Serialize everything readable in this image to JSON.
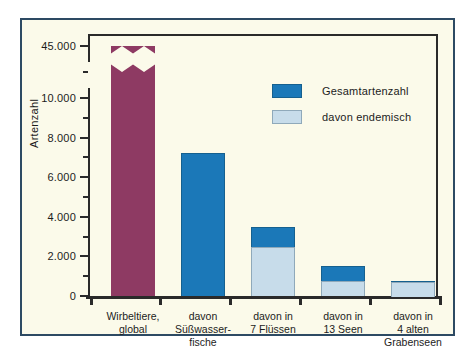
{
  "chart_data": {
    "type": "bar",
    "title": "",
    "xlabel": "",
    "ylabel": "Artenzahl",
    "grid": false,
    "legend_position": "inside-top-right",
    "axis_break": {
      "present": true,
      "below": 10000,
      "above": 45000,
      "note": "y-axis is broken between 10.000 and 45.000"
    },
    "ylim": [
      0,
      10000
    ],
    "yticks_major": [
      0,
      2000,
      4000,
      6000,
      8000,
      10000,
      45000
    ],
    "ytick_labels": [
      "0",
      "2.000",
      "4.000",
      "6.000",
      "8.000",
      "10.000",
      "45.000"
    ],
    "yticks_minor": [
      1000,
      3000,
      5000,
      7000,
      9000
    ],
    "categories": [
      "Wirbeltiere,\nglobal",
      "davon\nSüßwasser-\nfische",
      "davon in\n7 Flüssen",
      "davon in\n13 Seen",
      "davon in\n4 alten\nGrabenseen"
    ],
    "series": [
      {
        "name": "Gesamtartenzahl",
        "color": "#1b78b8",
        "values": [
          45000,
          7200,
          3500,
          1500,
          750
        ]
      },
      {
        "name": "davon endemisch",
        "color": "#c7dcea",
        "values": [
          null,
          null,
          2500,
          750,
          750
        ]
      }
    ],
    "special_bar": {
      "index": 0,
      "label": "Wirbeltiere, global",
      "color": "#8e3a63",
      "value": 45000,
      "broken": true
    },
    "legend": [
      {
        "label": "Gesamtartenzahl",
        "swatch": "total"
      },
      {
        "label": "davon endemisch",
        "swatch": "endemic"
      }
    ]
  },
  "colors": {
    "frame_border": "#2d4a63",
    "figure_background": "#fbfaea",
    "axis": "#2a2a2a",
    "series_total": "#1b78b8",
    "series_endemic": "#c7dcea",
    "global_bar": "#8e3a63"
  }
}
